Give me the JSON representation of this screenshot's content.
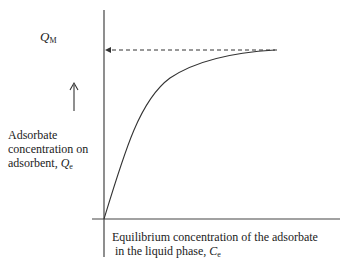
{
  "diagram": {
    "qm_label": "Q",
    "qm_sub": "M",
    "y_label": {
      "line1": "Adsorbate",
      "line2": "concentration on",
      "line3": "adsorbent, ",
      "var": "Q",
      "sub": "e"
    },
    "x_label": {
      "line1": "Equilibrium concentration of the adsorbate",
      "line2": " in the liquid phase, ",
      "var": "C",
      "sub": "e"
    }
  }
}
